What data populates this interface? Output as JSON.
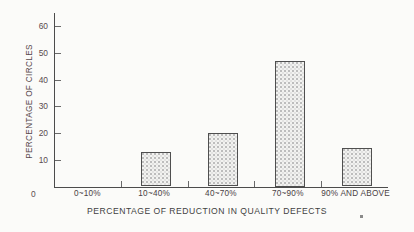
{
  "chart_data": {
    "type": "bar",
    "title": "",
    "subtitle": "",
    "xlabel": "PERCENTAGE OF REDUCTION IN QUALITY DEFECTS",
    "ylabel": "PERCENTAGE OF CIRCLES",
    "categories": [
      "0~10%",
      "10~40%",
      "40~70%",
      "70~90%",
      "90% AND ABOVE"
    ],
    "values": [
      0,
      13,
      20,
      47,
      14.5
    ],
    "ylim": [
      0,
      65
    ],
    "yticks": [
      10,
      20,
      30,
      40,
      50,
      60
    ],
    "ytick_labels": [
      "10",
      "20",
      "30",
      "40",
      "50",
      "60"
    ],
    "origin_label": "0",
    "grid": false,
    "legend": null,
    "bar_fill": "#f2f2f0",
    "bar_edge": "#4f4f4f",
    "axis_color": "#4c4c4c",
    "background": "#fbfbf9",
    "series": [
      {
        "name": "Percentage of circles",
        "values": [
          0,
          13,
          20,
          47,
          14.5
        ]
      }
    ]
  },
  "annotations": {
    "corner_mark": ""
  }
}
